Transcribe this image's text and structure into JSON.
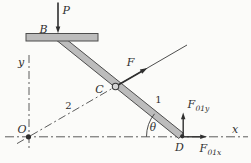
{
  "figure": {
    "kind": "statics-linkage-free-body-diagram",
    "colors": {
      "background": "#fbfbf9",
      "ink": "#2f2f2f",
      "centerline": "#5c5c5c",
      "bar_fill": "#bcbcbc",
      "bar_stroke": "#4d4d4d",
      "pin_fill": "#d6d6d6"
    },
    "labels": {
      "force_p": "P",
      "point_b": "B",
      "axis_y": "y",
      "origin_o": "O",
      "link_2": "2",
      "point_c": "C",
      "force_f": "F",
      "link_1": "1",
      "angle_theta": "θ",
      "reaction_f01y_symbol": "F",
      "reaction_f01y_subscript": "01y",
      "axis_x": "x",
      "point_d": "D",
      "reaction_f01x_symbol": "F",
      "reaction_f01x_subscript": "01x"
    }
  }
}
